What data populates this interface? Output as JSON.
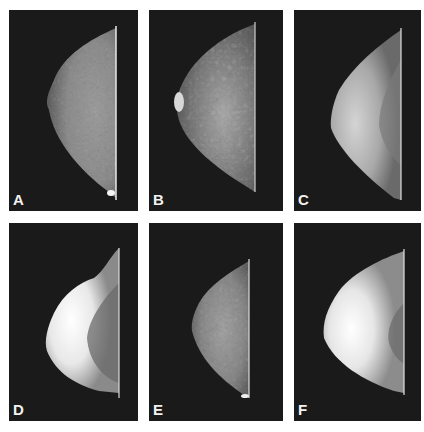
{
  "figure": {
    "panels": [
      {
        "label": "A",
        "appearance": "fatty/scattered fibroglandular tissue"
      },
      {
        "label": "B",
        "appearance": "heterogeneous fibroglandular pattern with prominent nipple"
      },
      {
        "label": "C",
        "appearance": "dense anterior tissue with darker posterior region"
      },
      {
        "label": "D",
        "appearance": "extremely dense bright anterior tissue"
      },
      {
        "label": "E",
        "appearance": "scattered fibroglandular tissue"
      },
      {
        "label": "F",
        "appearance": "extremely dense homogeneous tissue"
      }
    ]
  }
}
